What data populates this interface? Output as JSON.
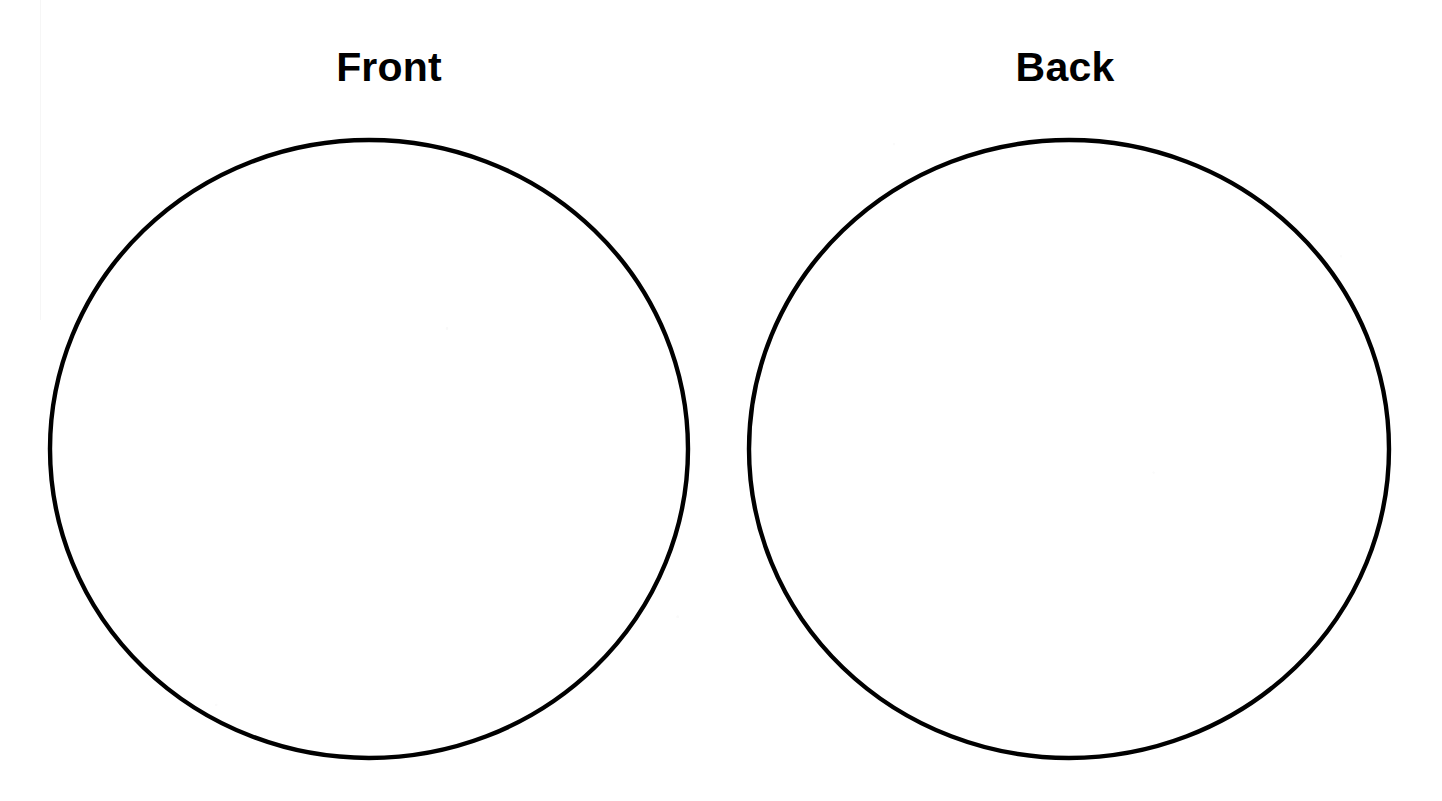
{
  "page": {
    "kind": "worksheet-template",
    "width": 1442,
    "height": 801,
    "background_color": "#ffffff",
    "ink_color": "#000000"
  },
  "labels": {
    "left": "Front",
    "right": "Back"
  },
  "shapes": [
    {
      "name": "front-circle",
      "type": "circle",
      "label": "Front",
      "center_x": 369,
      "center_y": 449,
      "radius_x": 319,
      "radius_y": 309,
      "stroke_color": "#000000",
      "stroke_width": 4.4,
      "fill": "none"
    },
    {
      "name": "back-circle",
      "type": "circle",
      "label": "Back",
      "center_x": 1069,
      "center_y": 449,
      "radius_x": 320,
      "radius_y": 309,
      "stroke_color": "#000000",
      "stroke_width": 4.4,
      "fill": "none"
    }
  ]
}
